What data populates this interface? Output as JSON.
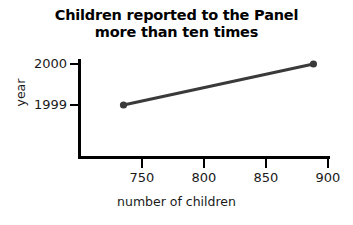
{
  "chart_data": {
    "type": "line",
    "title": "Children reported to the Panel\nmore than ten times",
    "xlabel": "number of children",
    "ylabel": "year",
    "x": [
      735,
      889
    ],
    "y": [
      1999,
      2000
    ],
    "categories": [
      "1999",
      "2000"
    ],
    "series": [
      {
        "name": "children reported",
        "points": [
          {
            "year": 1999,
            "number_of_children": 735
          },
          {
            "year": 2000,
            "number_of_children": 889
          }
        ]
      }
    ],
    "xlim": [
      710,
      913
    ],
    "ylim": [
      1998.3,
      2000.15
    ],
    "xticks": [
      750,
      800,
      850,
      900
    ],
    "yticks": [
      1999,
      2000
    ],
    "xticklabels": [
      "750",
      "800",
      "850",
      "900"
    ],
    "yticklabels": [
      "1999",
      "2000"
    ],
    "grid": false,
    "legend": false,
    "marker": "circle",
    "line_color": "#3a3a3a",
    "marker_color": "#3a3a3a",
    "axis_color": "#000000"
  },
  "axes": {
    "title_line_1": "Children reported to the Panel",
    "title_line_2": "more than ten times",
    "x_title": "number of children",
    "y_title": "year",
    "x_tick_labels": [
      "750",
      "800",
      "850",
      "900"
    ],
    "y_tick_labels": [
      "2000",
      "1999"
    ]
  }
}
